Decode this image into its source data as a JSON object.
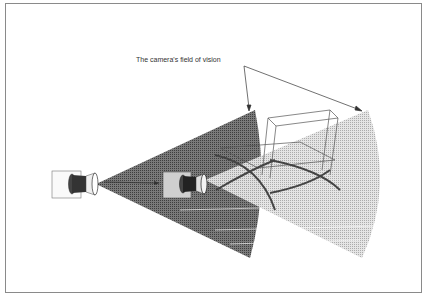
{
  "diagram": {
    "annotation": "The camera's field of vision",
    "elements": [
      {
        "name": "camera-1",
        "description": "Camera at left, casting a wide dark field of vision cone"
      },
      {
        "name": "camera-2",
        "description": "Camera in middle, casting a lighter field of vision cone"
      },
      {
        "name": "chair",
        "description": "Barcelona-style wireframe chair within the fields of vision"
      }
    ],
    "colors": {
      "dark_cone": "#5a5a5a",
      "light_cone": "#bdbdbd",
      "frame": "#8a8a8a",
      "text": "#333333"
    }
  }
}
